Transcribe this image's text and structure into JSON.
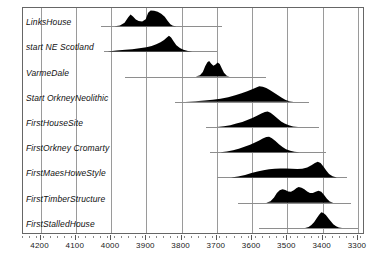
{
  "chart_data": {
    "type": "area",
    "title": "",
    "xlabel": "",
    "ylabel": "",
    "xlim": [
      4250,
      3280
    ],
    "x_direction": "descending",
    "grid": true,
    "legend": false,
    "xticks": [
      4200,
      4100,
      4000,
      3900,
      3800,
      3700,
      3600,
      3500,
      3400,
      3300
    ],
    "xtick_labels": [
      "4200",
      "4100",
      "4000",
      "3900",
      "3800",
      "3700",
      "3600",
      "3500",
      "3400",
      "3300"
    ],
    "categories": [
      "LinksHouse",
      "start NE Scotland",
      "VarmeDale",
      "Start OrkneyNeolithic",
      "FirstHouseSite",
      "FirstOrkney Cromarty",
      "FirstMaesHoweStyle",
      "FirstTimberStructure",
      "FirstStalledHouse"
    ],
    "series": [
      {
        "name": "LinksHouse",
        "range_start": 4030,
        "range_end": 3685,
        "peak": 3895,
        "density": [
          [
            3990,
            0.0
          ],
          [
            3975,
            0.05
          ],
          [
            3962,
            0.22
          ],
          [
            3952,
            0.55
          ],
          [
            3945,
            0.74
          ],
          [
            3938,
            0.62
          ],
          [
            3930,
            0.42
          ],
          [
            3922,
            0.33
          ],
          [
            3912,
            0.3
          ],
          [
            3902,
            0.44
          ],
          [
            3895,
            0.85
          ],
          [
            3888,
            1.0
          ],
          [
            3878,
            0.98
          ],
          [
            3868,
            0.92
          ],
          [
            3858,
            0.8
          ],
          [
            3848,
            0.6
          ],
          [
            3840,
            0.35
          ],
          [
            3832,
            0.12
          ],
          [
            3825,
            0.03
          ],
          [
            3815,
            0.0
          ]
        ]
      },
      {
        "name": "start NE Scotland",
        "range_start": 4020,
        "range_end": 3700,
        "peak": 3835,
        "density": [
          [
            4010,
            0.0
          ],
          [
            3985,
            0.05
          ],
          [
            3960,
            0.1
          ],
          [
            3940,
            0.14
          ],
          [
            3920,
            0.2
          ],
          [
            3900,
            0.27
          ],
          [
            3885,
            0.35
          ],
          [
            3872,
            0.45
          ],
          [
            3860,
            0.58
          ],
          [
            3850,
            0.72
          ],
          [
            3842,
            0.88
          ],
          [
            3836,
            1.0
          ],
          [
            3830,
            0.88
          ],
          [
            3822,
            0.62
          ],
          [
            3815,
            0.4
          ],
          [
            3805,
            0.22
          ],
          [
            3795,
            0.1
          ],
          [
            3782,
            0.03
          ],
          [
            3770,
            0.0
          ]
        ]
      },
      {
        "name": "VarmeDale",
        "range_start": 3960,
        "range_end": 3560,
        "peak": 3720,
        "density": [
          [
            3760,
            0.0
          ],
          [
            3748,
            0.08
          ],
          [
            3740,
            0.3
          ],
          [
            3733,
            0.68
          ],
          [
            3727,
            0.92
          ],
          [
            3722,
            1.0
          ],
          [
            3716,
            0.82
          ],
          [
            3710,
            0.7
          ],
          [
            3704,
            0.78
          ],
          [
            3698,
            0.9
          ],
          [
            3692,
            0.8
          ],
          [
            3686,
            0.52
          ],
          [
            3680,
            0.25
          ],
          [
            3672,
            0.06
          ],
          [
            3664,
            0.0
          ]
        ]
      },
      {
        "name": "Start OrkneyNeolithic",
        "range_start": 3820,
        "range_end": 3440,
        "peak": 3580,
        "density": [
          [
            3790,
            0.0
          ],
          [
            3760,
            0.04
          ],
          [
            3735,
            0.08
          ],
          [
            3712,
            0.13
          ],
          [
            3690,
            0.2
          ],
          [
            3668,
            0.3
          ],
          [
            3648,
            0.42
          ],
          [
            3630,
            0.55
          ],
          [
            3614,
            0.68
          ],
          [
            3600,
            0.8
          ],
          [
            3590,
            0.9
          ],
          [
            3580,
            1.0
          ],
          [
            3570,
            0.96
          ],
          [
            3560,
            0.88
          ],
          [
            3550,
            0.76
          ],
          [
            3540,
            0.62
          ],
          [
            3528,
            0.44
          ],
          [
            3516,
            0.26
          ],
          [
            3505,
            0.12
          ],
          [
            3494,
            0.04
          ],
          [
            3482,
            0.0
          ]
        ]
      },
      {
        "name": "FirstHouseSite",
        "range_start": 3730,
        "range_end": 3410,
        "peak": 3558,
        "density": [
          [
            3700,
            0.0
          ],
          [
            3680,
            0.05
          ],
          [
            3662,
            0.12
          ],
          [
            3645,
            0.22
          ],
          [
            3628,
            0.33
          ],
          [
            3612,
            0.46
          ],
          [
            3598,
            0.6
          ],
          [
            3585,
            0.74
          ],
          [
            3574,
            0.86
          ],
          [
            3564,
            0.96
          ],
          [
            3556,
            1.0
          ],
          [
            3548,
            0.92
          ],
          [
            3538,
            0.74
          ],
          [
            3528,
            0.54
          ],
          [
            3518,
            0.36
          ],
          [
            3508,
            0.22
          ],
          [
            3496,
            0.11
          ],
          [
            3484,
            0.04
          ],
          [
            3470,
            0.0
          ]
        ]
      },
      {
        "name": "FirstOrkney Cromarty",
        "range_start": 3720,
        "range_end": 3390,
        "peak": 3552,
        "density": [
          [
            3690,
            0.0
          ],
          [
            3672,
            0.05
          ],
          [
            3654,
            0.13
          ],
          [
            3638,
            0.23
          ],
          [
            3622,
            0.35
          ],
          [
            3606,
            0.48
          ],
          [
            3592,
            0.62
          ],
          [
            3580,
            0.76
          ],
          [
            3570,
            0.88
          ],
          [
            3560,
            0.97
          ],
          [
            3552,
            1.0
          ],
          [
            3544,
            0.9
          ],
          [
            3534,
            0.72
          ],
          [
            3524,
            0.52
          ],
          [
            3514,
            0.34
          ],
          [
            3504,
            0.2
          ],
          [
            3492,
            0.09
          ],
          [
            3480,
            0.03
          ],
          [
            3466,
            0.0
          ]
        ]
      },
      {
        "name": "FirstMaesHoweStyle",
        "range_start": 3700,
        "range_end": 3330,
        "peak": 3415,
        "density": [
          [
            3660,
            0.0
          ],
          [
            3640,
            0.06
          ],
          [
            3620,
            0.16
          ],
          [
            3602,
            0.28
          ],
          [
            3585,
            0.38
          ],
          [
            3568,
            0.46
          ],
          [
            3552,
            0.52
          ],
          [
            3536,
            0.56
          ],
          [
            3520,
            0.58
          ],
          [
            3504,
            0.58
          ],
          [
            3488,
            0.56
          ],
          [
            3472,
            0.54
          ],
          [
            3458,
            0.56
          ],
          [
            3444,
            0.64
          ],
          [
            3432,
            0.78
          ],
          [
            3422,
            0.92
          ],
          [
            3414,
            1.0
          ],
          [
            3406,
            0.92
          ],
          [
            3398,
            0.7
          ],
          [
            3390,
            0.44
          ],
          [
            3382,
            0.22
          ],
          [
            3372,
            0.08
          ],
          [
            3360,
            0.0
          ]
        ]
      },
      {
        "name": "FirstTimberStructure",
        "range_start": 3640,
        "range_end": 3320,
        "peak": 3470,
        "density": [
          [
            3560,
            0.0
          ],
          [
            3548,
            0.1
          ],
          [
            3538,
            0.34
          ],
          [
            3530,
            0.62
          ],
          [
            3522,
            0.8
          ],
          [
            3514,
            0.86
          ],
          [
            3506,
            0.82
          ],
          [
            3498,
            0.72
          ],
          [
            3490,
            0.7
          ],
          [
            3482,
            0.8
          ],
          [
            3474,
            0.94
          ],
          [
            3468,
            1.0
          ],
          [
            3460,
            0.96
          ],
          [
            3452,
            0.86
          ],
          [
            3444,
            0.72
          ],
          [
            3436,
            0.62
          ],
          [
            3428,
            0.62
          ],
          [
            3420,
            0.7
          ],
          [
            3412,
            0.76
          ],
          [
            3404,
            0.7
          ],
          [
            3396,
            0.5
          ],
          [
            3388,
            0.26
          ],
          [
            3380,
            0.08
          ],
          [
            3370,
            0.0
          ]
        ]
      },
      {
        "name": "FirstStalledHouse",
        "range_start": 3580,
        "range_end": 3300,
        "peak": 3405,
        "density": [
          [
            3450,
            0.0
          ],
          [
            3440,
            0.06
          ],
          [
            3432,
            0.18
          ],
          [
            3424,
            0.38
          ],
          [
            3417,
            0.62
          ],
          [
            3410,
            0.85
          ],
          [
            3404,
            1.0
          ],
          [
            3398,
            0.96
          ],
          [
            3391,
            0.82
          ],
          [
            3384,
            0.62
          ],
          [
            3377,
            0.42
          ],
          [
            3370,
            0.24
          ],
          [
            3362,
            0.1
          ],
          [
            3354,
            0.03
          ],
          [
            3345,
            0.0
          ]
        ]
      }
    ]
  },
  "style": {
    "fill_color": "#000000",
    "grid_color": "#9a9a9a",
    "frame_color": "#666666",
    "range_line_color": "#8e8e8e",
    "background": "#ffffff"
  }
}
